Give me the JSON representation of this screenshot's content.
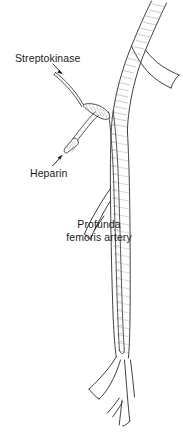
{
  "figure": {
    "background_color": "#ffffff",
    "ink_color": "#2b2b2b",
    "shade_color": "#8a8a8a"
  },
  "labels": {
    "streptokinase": "Streptokinase",
    "heparin": "Heparin",
    "profunda_line1": "Profunda",
    "profunda_line2": "femoris artery"
  },
  "anatomy": {
    "parts": [
      "common-femoral-artery",
      "superficial-femoral-artery",
      "profunda-femoris-artery",
      "iliac-bifurcation",
      "popliteal-bifurcation"
    ]
  },
  "devices": {
    "parts": [
      "infusion-catheter",
      "y-connector-hub",
      "streptokinase-infusion-line",
      "heparin-infusion-line",
      "luer-hub",
      "catheter-tip"
    ]
  }
}
